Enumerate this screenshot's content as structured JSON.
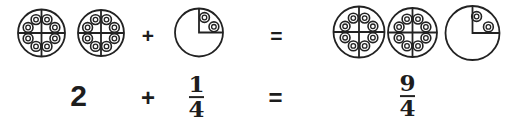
{
  "equation": {
    "whole": "2",
    "plus": "+",
    "equals": "=",
    "addend": {
      "numerator": "1",
      "denominator": "4"
    },
    "result": {
      "numerator": "9",
      "denominator": "4"
    }
  },
  "illustration": {
    "description": "Cookie pies showing that 2 whole pies plus one quarter pie equals nine quarters",
    "left_side": {
      "whole_pies": 2,
      "slices_per_pie": 4,
      "cookies_per_whole_pie": 8,
      "partial_pie": {
        "slices_shown": 1,
        "of_slices": 4,
        "cookies": 2
      }
    },
    "right_side": {
      "whole_pies": 2,
      "slices_per_pie": 4,
      "cookies_per_whole_pie": 8,
      "partial_pie": {
        "slices_shown": 1,
        "of_slices": 4,
        "cookies": 2
      }
    }
  },
  "colors": {
    "stroke": "#222222",
    "text": "#1d1d1d",
    "background": "#ffffff"
  }
}
